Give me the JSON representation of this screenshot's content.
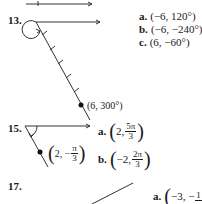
{
  "problems": [
    {
      "number": "13.",
      "point_label": "(6, 300°)",
      "answers": [
        {
          "letter": "a.",
          "text": "(−6, 120°)"
        },
        {
          "letter": "b.",
          "text": "(−6, −240°)"
        },
        {
          "letter": "c.",
          "text": "(6, −60°)"
        }
      ]
    },
    {
      "number": "15.",
      "point_label": {
        "r": "2, −",
        "num": "π",
        "den": "3"
      },
      "answers": [
        {
          "letter": "a.",
          "r": "2,",
          "num": "5π",
          "den": "3"
        },
        {
          "letter": "b.",
          "r": "−2,",
          "num": "2π",
          "den": "3"
        }
      ]
    },
    {
      "number": "17.",
      "answers": [
        {
          "letter": "a.",
          "r": "−3, −",
          "num": "1",
          "den": ""
        }
      ]
    }
  ]
}
